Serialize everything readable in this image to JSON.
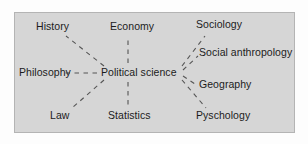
{
  "figure": {
    "type": "concept-map",
    "center_label": "Political science",
    "frame": {
      "background_color": "#d6d6d6",
      "border_color": "#b4b4b4"
    },
    "edge_style": "dashed",
    "edge_color": "#555555"
  },
  "nodes": {
    "center": "Political science",
    "history": "History",
    "economy": "Economy",
    "sociology": "Sociology",
    "philosophy": "Philosophy",
    "social_anthropology": "Social anthropology",
    "geography": "Geography",
    "law": "Law",
    "statistics": "Statistics",
    "psychology": "Pyschology"
  },
  "edges": [
    {
      "from": "Political science",
      "to": "History"
    },
    {
      "from": "Political science",
      "to": "Economy"
    },
    {
      "from": "Political science",
      "to": "Sociology"
    },
    {
      "from": "Political science",
      "to": "Philosophy"
    },
    {
      "from": "Political science",
      "to": "Social anthropology"
    },
    {
      "from": "Political science",
      "to": "Geography"
    },
    {
      "from": "Political science",
      "to": "Law"
    },
    {
      "from": "Political science",
      "to": "Statistics"
    },
    {
      "from": "Political science",
      "to": "Pyschology"
    }
  ]
}
